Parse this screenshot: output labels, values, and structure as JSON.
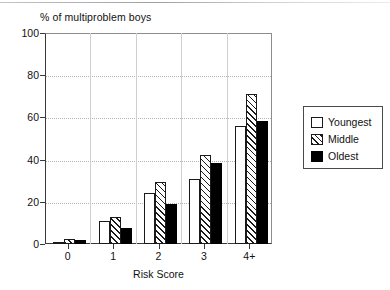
{
  "chart_data": {
    "type": "bar",
    "title": "% of multiproblem boys",
    "xlabel": "Risk Score",
    "ylabel": "",
    "categories": [
      "0",
      "1",
      "2",
      "3",
      "4+"
    ],
    "series": [
      {
        "name": "Youngest",
        "fill": "white",
        "values": [
          1,
          11,
          24,
          31,
          56
        ]
      },
      {
        "name": "Middle",
        "fill": "hatched",
        "values": [
          2.5,
          13,
          29.5,
          42,
          71
        ]
      },
      {
        "name": "Oldest",
        "fill": "black",
        "values": [
          2,
          7.5,
          19,
          38.5,
          58.5
        ]
      }
    ],
    "ylim": [
      0,
      100
    ],
    "yticks": [
      0,
      20,
      40,
      60,
      80,
      100
    ],
    "ytick_labels": [
      "0",
      "20",
      "40",
      "60",
      "80",
      "100"
    ],
    "grid": "horizontal-dotted",
    "legend_position": "right-outside",
    "legend_entries": [
      "Youngest",
      "Middle",
      "Oldest"
    ],
    "colors": {
      "axis": "#3a3a3a",
      "grid": "#b2b2b2",
      "bar_outline": "#1a1a1a",
      "oldest_fill": "#000000",
      "background": "#ffffff"
    }
  }
}
